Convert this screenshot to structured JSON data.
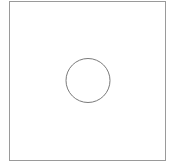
{
  "diagram": {
    "canvas": {
      "width": 175,
      "height": 168,
      "background": "#ffffff"
    },
    "shapes": [
      {
        "type": "rect",
        "name": "square-frame",
        "x": 9.5,
        "y": 1.5,
        "width": 156,
        "height": 159,
        "stroke": "#9a9a9a",
        "stroke_width": 1,
        "fill": "none"
      },
      {
        "type": "circle",
        "name": "center-circle",
        "cx": 88,
        "cy": 80.5,
        "r": 22,
        "stroke": "#7a7a7a",
        "stroke_width": 1,
        "fill": "none"
      }
    ]
  }
}
